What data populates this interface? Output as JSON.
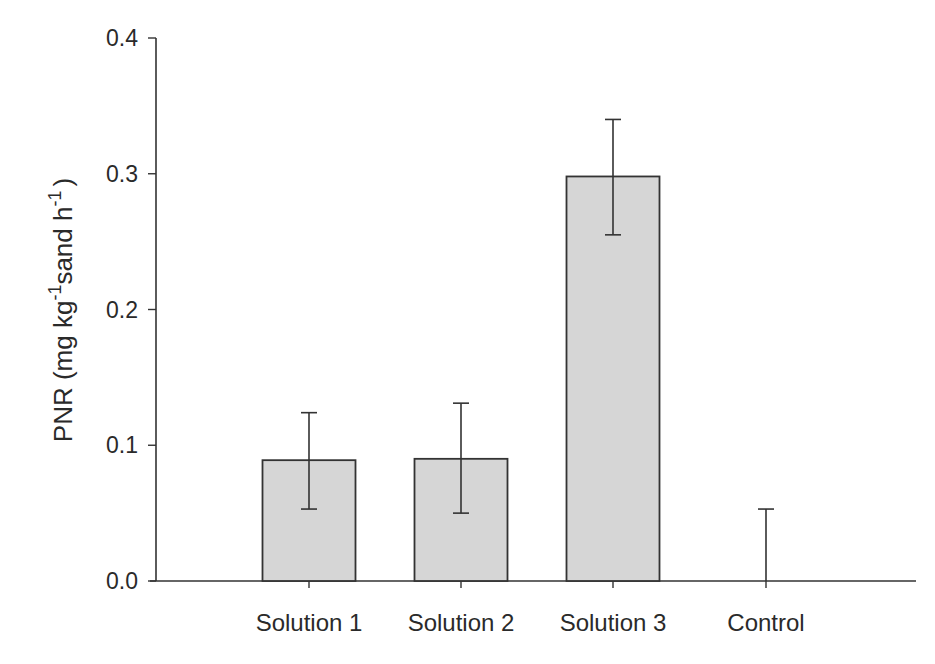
{
  "chart_data": {
    "type": "bar",
    "title": "",
    "xlabel": "",
    "ylabel": "PNR (mg kg-1 sand h-1)",
    "ylabel_parts": {
      "pre": "PNR (mg kg",
      "sup1": "-1",
      "mid": "sand h",
      "sup2": "-1",
      "post": ")"
    },
    "categories": [
      "Solution 1",
      "Solution 2",
      "Solution 3",
      "Control"
    ],
    "values": [
      0.089,
      0.09,
      0.298,
      0.0
    ],
    "error_upper": [
      0.124,
      0.131,
      0.34,
      0.053
    ],
    "error_lower": [
      0.053,
      0.05,
      0.255,
      0.0
    ],
    "ylim": [
      0.0,
      0.4
    ],
    "yticks": [
      "0.0",
      "0.1",
      "0.2",
      "0.3",
      "0.4"
    ],
    "grid": false,
    "legend": null,
    "bar_color": "#d6d6d6",
    "edge_color": "#333333"
  }
}
